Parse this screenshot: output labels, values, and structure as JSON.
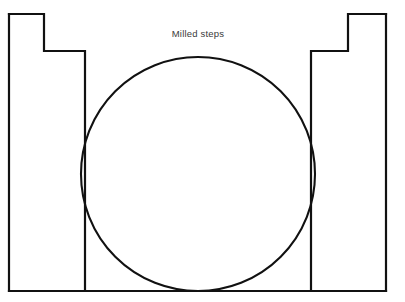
{
  "figure": {
    "title": "Milled steps",
    "caption_x": 198,
    "caption_y": 37,
    "background_color": "#ffffff",
    "line_color": "#111111",
    "text_color": "#3a3a3a",
    "canvas": {
      "width": 405,
      "height": 302
    }
  },
  "geometry": {
    "type": "cross-section",
    "description": "Symmetric stepped block profile with an inscribed circle tangent to both inner risers and the base",
    "units": "pixels",
    "outline_points": [
      [
        9,
        14
      ],
      [
        44,
        14
      ],
      [
        44,
        51
      ],
      [
        85,
        51
      ],
      [
        85,
        291
      ],
      [
        9,
        291
      ],
      [
        9,
        14
      ]
    ],
    "left_step": {
      "outer_edge_x": 9,
      "top_y": 14,
      "upper_tread_end_x": 44,
      "riser_bottom_y": 51,
      "shoulder_end_x": 85,
      "base_y": 291
    },
    "right_step": {
      "outer_edge_x": 386,
      "top_y": 14,
      "upper_tread_end_x": 348,
      "riser_bottom_y": 51,
      "shoulder_end_x": 311,
      "base_y": 291
    },
    "base_line": {
      "x1": 9,
      "x2": 386,
      "y": 291
    },
    "circle": {
      "center_x": 198,
      "center_y": 174,
      "radius": 117,
      "diameter": 234,
      "left_tangent_x": 85,
      "right_tangent_x": 311,
      "top_y": 57,
      "bottom_tangent_y": 291
    }
  }
}
